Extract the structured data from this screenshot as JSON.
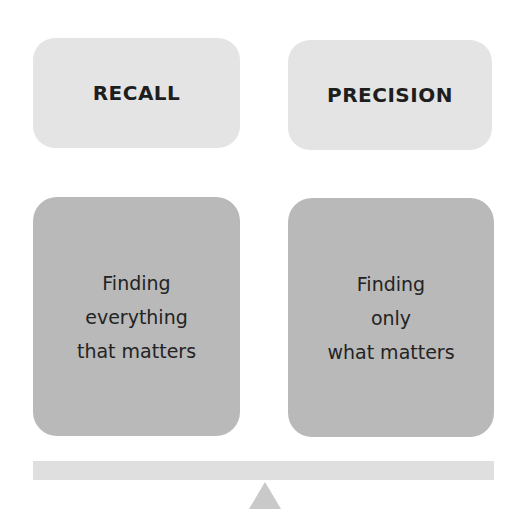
{
  "diagram": {
    "left": {
      "label": "RECALL",
      "description": "Finding\neverything\nthat matters"
    },
    "right": {
      "label": "PRECISION",
      "description": "Finding\nonly\nwhat matters"
    },
    "balance": {
      "beam": "balance-beam",
      "fulcrum": "triangle-fulcrum"
    },
    "colors": {
      "label_box": "#e4e4e4",
      "description_box": "#b9b9b9",
      "beam": "#dfdfdf",
      "fulcrum": "#c9c9c9",
      "text": "#1e1e1e"
    }
  }
}
